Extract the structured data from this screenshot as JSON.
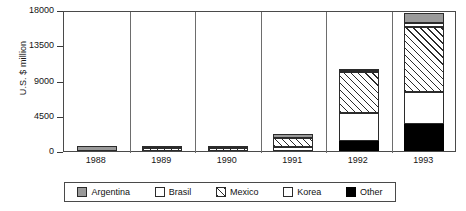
{
  "chart_data": {
    "type": "bar",
    "subtype": "stacked",
    "title": "",
    "xlabel": "",
    "ylabel": "U.S. $ million",
    "ylim": [
      0,
      18000
    ],
    "yticks": [
      0,
      4500,
      9000,
      13500,
      18000
    ],
    "ytick_labels": [
      "0",
      "4500",
      "9000",
      "13500",
      "18000"
    ],
    "grid": false,
    "panel_separators": true,
    "legend_position": "bottom",
    "categories": [
      "1988",
      "1989",
      "1990",
      "1991",
      "1992",
      "1993"
    ],
    "series": [
      {
        "name": "Argentina",
        "fill": "gray",
        "color": "#9a9a9a",
        "values": [
          640,
          180,
          130,
          520,
          260,
          1280
        ]
      },
      {
        "name": "Brasil",
        "fill": "white",
        "color": "#ffffff",
        "values": [
          0,
          0,
          0,
          0,
          70,
          510
        ]
      },
      {
        "name": "Mexico",
        "fill": "hatch",
        "color": "#ffffff",
        "values": [
          0,
          330,
          380,
          1150,
          5240,
          8300
        ]
      },
      {
        "name": "Korea",
        "fill": "white",
        "color": "#ffffff",
        "values": [
          0,
          0,
          0,
          510,
          3580,
          4090
        ]
      },
      {
        "name": "Other",
        "fill": "black",
        "color": "#000000",
        "values": [
          0,
          0,
          0,
          0,
          1280,
          3450
        ]
      }
    ],
    "totals": [
      640,
      510,
      510,
      2180,
      10430,
      17630
    ]
  },
  "axis": {
    "y_title": "U.S. $ million",
    "y_ticks": [
      "18000",
      "13500",
      "9000",
      "4500",
      "0"
    ],
    "x_ticks": [
      "1988",
      "1989",
      "1990",
      "1991",
      "1992",
      "1993"
    ]
  },
  "legend": {
    "items": [
      {
        "label": "Argentina"
      },
      {
        "label": "Brasil"
      },
      {
        "label": "Mexico"
      },
      {
        "label": "Korea"
      },
      {
        "label": "Other"
      }
    ]
  }
}
